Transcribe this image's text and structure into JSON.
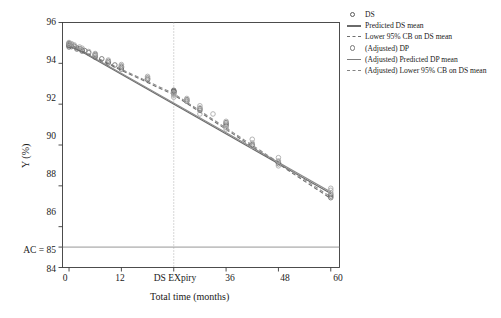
{
  "chart_data": {
    "type": "scatter",
    "title": "",
    "xlabel": "Total time (months)",
    "ylabel": "Y (%)",
    "xlim": [
      -1.5,
      62
    ],
    "ylim": [
      84,
      96
    ],
    "xticks": [
      0,
      12,
      24,
      36,
      48,
      60
    ],
    "xticklabels": [
      "0",
      "12",
      "DS EXpiry",
      "36",
      "48",
      "60"
    ],
    "yticks": [
      84,
      85,
      86,
      88,
      90,
      92,
      94,
      96
    ],
    "yticklabels": [
      "84",
      "AC = 85",
      "86",
      "88",
      "90",
      "92",
      "94",
      "96"
    ],
    "grid": false,
    "legend_position": "right-outside",
    "annotations": [
      {
        "name": "acceptance-criterion-line",
        "type": "hline",
        "y": 85,
        "label": "AC = 85",
        "color": "#8a8a8a"
      },
      {
        "name": "ds-expiry-line",
        "type": "vline",
        "x": 24,
        "label": "DS EXpiry",
        "style": "dotted",
        "color": "#9a9a9a"
      }
    ],
    "series": [
      {
        "name": "DS",
        "type": "scatter",
        "marker": "open-circle",
        "color": "#6b6b6b",
        "points": [
          {
            "x": 0,
            "y": 94.98
          },
          {
            "x": 0,
            "y": 94.92
          },
          {
            "x": 0,
            "y": 94.86
          },
          {
            "x": 0,
            "y": 94.8
          },
          {
            "x": 0,
            "y": 94.95
          },
          {
            "x": 0,
            "y": 94.88
          },
          {
            "x": 0.6,
            "y": 94.9
          },
          {
            "x": 0.6,
            "y": 94.82
          },
          {
            "x": 1.2,
            "y": 94.84
          },
          {
            "x": 1.8,
            "y": 94.76
          },
          {
            "x": 1.8,
            "y": 94.7
          },
          {
            "x": 2.4,
            "y": 94.72
          },
          {
            "x": 3,
            "y": 94.66
          },
          {
            "x": 3,
            "y": 94.6
          },
          {
            "x": 3.6,
            "y": 94.62
          },
          {
            "x": 4.5,
            "y": 94.52
          },
          {
            "x": 6,
            "y": 94.38
          },
          {
            "x": 6,
            "y": 94.3
          },
          {
            "x": 6,
            "y": 94.44
          },
          {
            "x": 7.5,
            "y": 94.22
          },
          {
            "x": 9,
            "y": 94.1
          },
          {
            "x": 9,
            "y": 94.02
          },
          {
            "x": 10.5,
            "y": 93.92
          },
          {
            "x": 12,
            "y": 93.8
          },
          {
            "x": 12,
            "y": 93.72
          },
          {
            "x": 12,
            "y": 93.86
          },
          {
            "x": 18,
            "y": 93.28
          },
          {
            "x": 18,
            "y": 93.2
          },
          {
            "x": 24,
            "y": 92.62
          },
          {
            "x": 24,
            "y": 92.56
          },
          {
            "x": 24,
            "y": 92.68
          },
          {
            "x": 24,
            "y": 92.5
          },
          {
            "x": 24,
            "y": 92.6
          },
          {
            "x": 24,
            "y": 92.64
          },
          {
            "x": 27,
            "y": 92.22
          },
          {
            "x": 27,
            "y": 92.14
          },
          {
            "x": 30,
            "y": 91.78
          },
          {
            "x": 30,
            "y": 91.7
          },
          {
            "x": 36,
            "y": 91.02
          },
          {
            "x": 36,
            "y": 90.94
          },
          {
            "x": 36,
            "y": 91.1
          },
          {
            "x": 42,
            "y": 90.02
          },
          {
            "x": 42,
            "y": 89.96
          },
          {
            "x": 48,
            "y": 89.16
          },
          {
            "x": 48,
            "y": 89.08
          },
          {
            "x": 60,
            "y": 87.58
          },
          {
            "x": 60,
            "y": 87.5
          },
          {
            "x": 60,
            "y": 87.42
          }
        ]
      },
      {
        "name": "(Adjusted) DP",
        "type": "scatter",
        "marker": "open-circle",
        "color": "#a8a8a8",
        "points": [
          {
            "x": 0,
            "y": 95.02
          },
          {
            "x": 0,
            "y": 94.94
          },
          {
            "x": 0.6,
            "y": 94.96
          },
          {
            "x": 1.2,
            "y": 94.9
          },
          {
            "x": 2.4,
            "y": 94.8
          },
          {
            "x": 3,
            "y": 94.74
          },
          {
            "x": 4.5,
            "y": 94.58
          },
          {
            "x": 6,
            "y": 94.48
          },
          {
            "x": 6,
            "y": 94.4
          },
          {
            "x": 9,
            "y": 94.16
          },
          {
            "x": 12,
            "y": 93.94
          },
          {
            "x": 12,
            "y": 93.86
          },
          {
            "x": 18,
            "y": 93.36
          },
          {
            "x": 18,
            "y": 93.26
          },
          {
            "x": 24,
            "y": 92.44
          },
          {
            "x": 24,
            "y": 92.34
          },
          {
            "x": 24,
            "y": 92.56
          },
          {
            "x": 27,
            "y": 92.28
          },
          {
            "x": 27,
            "y": 92.18
          },
          {
            "x": 30,
            "y": 91.92
          },
          {
            "x": 30,
            "y": 91.82
          },
          {
            "x": 30,
            "y": 91.52
          },
          {
            "x": 33,
            "y": 91.52
          },
          {
            "x": 36,
            "y": 91.16
          },
          {
            "x": 36,
            "y": 90.86
          },
          {
            "x": 36,
            "y": 90.78
          },
          {
            "x": 42,
            "y": 90.28
          },
          {
            "x": 42,
            "y": 90.1
          },
          {
            "x": 42,
            "y": 89.94
          },
          {
            "x": 48,
            "y": 89.38
          },
          {
            "x": 48,
            "y": 89.22
          },
          {
            "x": 48,
            "y": 88.98
          },
          {
            "x": 60,
            "y": 87.88
          },
          {
            "x": 60,
            "y": 87.78
          },
          {
            "x": 60,
            "y": 87.66
          }
        ]
      },
      {
        "name": "Predicted DS mean",
        "type": "line",
        "style": "solid",
        "color": "#6a6a6a",
        "x": [
          0,
          60
        ],
        "y": [
          94.92,
          87.62
        ]
      },
      {
        "name": "Lower 95% CB on DS mean",
        "type": "line",
        "style": "dashed",
        "color": "#6f6f6f",
        "x": [
          0,
          24,
          60
        ],
        "y": [
          94.86,
          92.46,
          87.38
        ]
      },
      {
        "name": "(Adjusted) Predicted DP mean",
        "type": "line",
        "style": "solid",
        "color": "#8a8a8a",
        "x": [
          0,
          60
        ],
        "y": [
          94.96,
          87.7
        ]
      },
      {
        "name": "(Adjusted) Lower 95% CB on DS mean",
        "type": "line",
        "style": "dashed",
        "color": "#8e8e8e",
        "x": [
          0,
          24,
          60
        ],
        "y": [
          94.9,
          92.52,
          87.46
        ]
      }
    ]
  },
  "axes": {
    "ylabel": "Y (%)",
    "xlabel": "Total time (months)",
    "yticklabels": [
      "96",
      "94",
      "92",
      "90",
      "88",
      "86",
      "84"
    ],
    "ac_label": "AC = 85",
    "xticklabels": [
      "0",
      "12",
      "DS EXpiry",
      "36",
      "48",
      "60"
    ]
  },
  "legend": {
    "items": [
      {
        "label": "DS",
        "key": "circle-dark"
      },
      {
        "label": "Predicted DS mean",
        "key": "line-solid-dark"
      },
      {
        "label": "Lower 95% CB on DS mean",
        "key": "line-dashed-dark"
      },
      {
        "label": "(Adjusted) DP",
        "key": "circle-light"
      },
      {
        "label": "(Adjusted) Predicted DP mean",
        "key": "line-solid-light"
      },
      {
        "label": "(Adjusted) Lower 95% CB on DS mean",
        "key": "line-dashed-light"
      }
    ]
  },
  "colors": {
    "ds_marker": "#6b6b6b",
    "dp_marker": "#a8a8a8",
    "ds_mean_line": "#6a6a6a",
    "dp_mean_line": "#8a8a8a",
    "ac_line": "#8a8a8a",
    "expiry_line": "#9a9a9a",
    "axis": "#3a3a3a",
    "text": "#1a1a1a"
  }
}
